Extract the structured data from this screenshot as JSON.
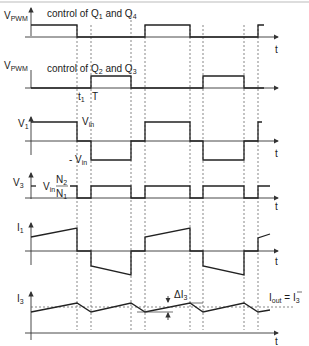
{
  "diagram": {
    "time_marks": {
      "t1": "t",
      "t1_sub": "1",
      "T": "T"
    },
    "axis_label": "t",
    "panels": [
      {
        "id": "vpwm1",
        "ylabel": "V",
        "ylabel_sub": "PWM",
        "caption": {
          "prefix": "control of Q",
          "sub_a": "1",
          "mid": " and  Q",
          "sub_b": "4"
        }
      },
      {
        "id": "vpwm2",
        "ylabel": "V",
        "ylabel_sub": "PWM",
        "caption": {
          "prefix": "control of Q",
          "sub_a": "2",
          "mid": "  and  Q",
          "sub_b": "3"
        }
      },
      {
        "id": "v1",
        "ylabel": "V",
        "ylabel_sub": "1",
        "levels": {
          "pos": "V",
          "pos_sub": "in",
          "neg": "- V",
          "neg_sub": "in"
        }
      },
      {
        "id": "v3",
        "ylabel": "V",
        "ylabel_sub": "3",
        "level": {
          "base": "V",
          "base_sub": "in",
          "num": "N",
          "num_sub": "2",
          "den": "N",
          "den_sub": "1"
        }
      },
      {
        "id": "i1",
        "ylabel": "I",
        "ylabel_sub": "1"
      },
      {
        "id": "i3",
        "ylabel": "I",
        "ylabel_sub": "3",
        "ripple": {
          "text": "ΔI",
          "sub": "3"
        },
        "average": {
          "lhs": "I",
          "lhs_sub": "out",
          "eq": " = ",
          "rhs": "I",
          "rhs_sub": "3"
        }
      }
    ],
    "dashed_x": [
      77,
      91,
      131,
      145,
      190,
      203,
      244,
      258
    ]
  }
}
